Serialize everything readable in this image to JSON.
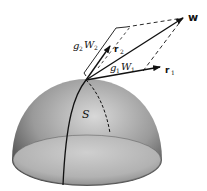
{
  "diagram": {
    "surface_label": "S",
    "vectors": {
      "w": {
        "label": "w"
      },
      "r1": {
        "label": "r",
        "sub": "1"
      },
      "r2": {
        "label": "r",
        "sub": "2"
      }
    },
    "components": {
      "g1w1": {
        "g": "g",
        "g_sub": "1",
        "w": "W",
        "w_sub": "1"
      },
      "g2w2": {
        "g": "g",
        "g_sub": "2",
        "w": "W",
        "w_sub": "2"
      }
    },
    "colors": {
      "ink": "#111111",
      "sphere_light": "#d6d6d6",
      "sphere_dark": "#4a4a4a",
      "base_fill": "#bdbdbd"
    }
  }
}
